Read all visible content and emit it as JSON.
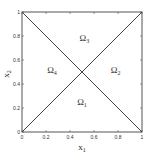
{
  "chart_data": {
    "type": "line",
    "title": "",
    "xlabel": "x",
    "xlabel_sub": "1",
    "ylabel": "x",
    "ylabel_sub": "2",
    "xlim": [
      0,
      1
    ],
    "ylim": [
      0,
      1
    ],
    "grid": false,
    "xticks": [
      0,
      0.2,
      0.4,
      0.6,
      0.8,
      1
    ],
    "xtick_labels": [
      "0",
      "0.2",
      "0.4",
      "0.6",
      "0.8",
      "1"
    ],
    "yticks": [
      0,
      0.2,
      0.4,
      0.6,
      0.8,
      1
    ],
    "ytick_labels": [
      "0",
      "0.2",
      "0.4",
      "0.6",
      "0.8",
      "1"
    ],
    "series": [
      {
        "name": "diagonal-1",
        "x": [
          0,
          1
        ],
        "y": [
          0,
          1
        ]
      },
      {
        "name": "diagonal-2",
        "x": [
          0,
          1
        ],
        "y": [
          1,
          0
        ]
      }
    ],
    "annotations": [
      {
        "text": "Ω",
        "sub": "1",
        "x": 0.5,
        "y": 0.25
      },
      {
        "text": "Ω",
        "sub": "2",
        "x": 0.78,
        "y": 0.52
      },
      {
        "text": "Ω",
        "sub": "3",
        "x": 0.52,
        "y": 0.78
      },
      {
        "text": "Ω",
        "sub": "4",
        "x": 0.25,
        "y": 0.52
      }
    ],
    "line_color": "#444444",
    "frame_color": "#555555"
  }
}
